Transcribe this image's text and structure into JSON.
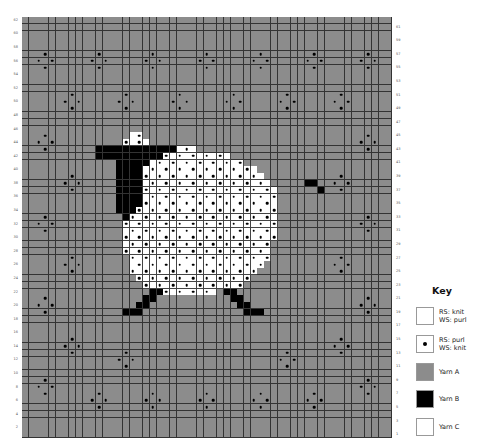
{
  "chart_data": {
    "type": "table",
    "grid": {
      "columns": 55,
      "rows": 62,
      "row_label_start": 1,
      "left_labels": "even rows",
      "right_labels": "odd rows"
    },
    "colors": {
      "yarn_a": "#8c8c8c",
      "yarn_b": "#000000",
      "yarn_c": "#ffffff",
      "grid_line": "#333333"
    },
    "background_purl_motifs": [
      {
        "center_col": 3,
        "center_row": 56
      },
      {
        "center_col": 11,
        "center_row": 56
      },
      {
        "center_col": 19,
        "center_row": 56
      },
      {
        "center_col": 27,
        "center_row": 56
      },
      {
        "center_col": 35,
        "center_row": 56
      },
      {
        "center_col": 43,
        "center_row": 56
      },
      {
        "center_col": 51,
        "center_row": 56
      },
      {
        "center_col": 7,
        "center_row": 50
      },
      {
        "center_col": 15,
        "center_row": 50
      },
      {
        "center_col": 23,
        "center_row": 50
      },
      {
        "center_col": 31,
        "center_row": 50
      },
      {
        "center_col": 39,
        "center_row": 50
      },
      {
        "center_col": 47,
        "center_row": 50
      },
      {
        "center_col": 3,
        "center_row": 44
      },
      {
        "center_col": 51,
        "center_row": 44
      },
      {
        "center_col": 7,
        "center_row": 38
      },
      {
        "center_col": 47,
        "center_row": 38
      },
      {
        "center_col": 3,
        "center_row": 32
      },
      {
        "center_col": 51,
        "center_row": 32
      },
      {
        "center_col": 7,
        "center_row": 26
      },
      {
        "center_col": 47,
        "center_row": 26
      },
      {
        "center_col": 3,
        "center_row": 20
      },
      {
        "center_col": 51,
        "center_row": 20
      },
      {
        "center_col": 7,
        "center_row": 14
      },
      {
        "center_col": 47,
        "center_row": 14
      },
      {
        "center_col": 3,
        "center_row": 8
      },
      {
        "center_col": 51,
        "center_row": 8
      },
      {
        "center_col": 15,
        "center_row": 12
      },
      {
        "center_col": 39,
        "center_row": 12
      },
      {
        "center_col": 11,
        "center_row": 6
      },
      {
        "center_col": 19,
        "center_row": 6
      },
      {
        "center_col": 27,
        "center_row": 6
      },
      {
        "center_col": 35,
        "center_row": 6
      },
      {
        "center_col": 43,
        "center_row": 6
      }
    ],
    "shapes_by_row_from_top": {
      "17": [
        {
          "c": 16,
          "n": 2,
          "y": "C",
          "dot_at": [
            17
          ]
        }
      ],
      "18": [
        {
          "c": 15,
          "n": 4,
          "y": "C"
        }
      ],
      "19": [
        {
          "c": 11,
          "n": 12,
          "y": "B"
        },
        {
          "c": 23,
          "n": 3,
          "y": "C"
        }
      ],
      "20": [
        {
          "c": 11,
          "n": 10,
          "y": "B"
        },
        {
          "c": 21,
          "n": 10,
          "y": "C"
        }
      ],
      "21": [
        {
          "c": 14,
          "n": 5,
          "y": "B"
        },
        {
          "c": 19,
          "n": 14,
          "y": "C"
        }
      ],
      "22": [
        {
          "c": 14,
          "n": 4,
          "y": "B"
        },
        {
          "c": 18,
          "n": 17,
          "y": "C"
        }
      ],
      "23": [
        {
          "c": 14,
          "n": 4,
          "y": "B"
        },
        {
          "c": 18,
          "n": 18,
          "y": "C"
        }
      ],
      "24": [
        {
          "c": 14,
          "n": 4,
          "y": "B"
        },
        {
          "c": 18,
          "n": 19,
          "y": "C"
        },
        {
          "c": 42,
          "n": 2,
          "y": "B"
        }
      ],
      "25": [
        {
          "c": 14,
          "n": 4,
          "y": "B"
        },
        {
          "c": 18,
          "n": 20,
          "y": "C"
        },
        {
          "c": 44,
          "n": 1,
          "y": "B"
        }
      ],
      "26": [
        {
          "c": 14,
          "n": 4,
          "y": "B"
        },
        {
          "c": 18,
          "n": 20,
          "y": "C"
        }
      ],
      "27": [
        {
          "c": 14,
          "n": 4,
          "y": "B"
        },
        {
          "c": 18,
          "n": 20,
          "y": "C"
        }
      ],
      "28": [
        {
          "c": 14,
          "n": 3,
          "y": "B"
        },
        {
          "c": 17,
          "n": 21,
          "y": "C"
        }
      ],
      "29": [
        {
          "c": 15,
          "n": 1,
          "y": "B"
        },
        {
          "c": 16,
          "n": 22,
          "y": "C"
        }
      ],
      "30": [
        {
          "c": 15,
          "n": 23,
          "y": "C"
        }
      ],
      "31": [
        {
          "c": 15,
          "n": 23,
          "y": "C"
        }
      ],
      "32": [
        {
          "c": 15,
          "n": 23,
          "y": "C"
        }
      ],
      "33": [
        {
          "c": 15,
          "n": 22,
          "y": "C"
        }
      ],
      "34": [
        {
          "c": 15,
          "n": 22,
          "y": "C"
        }
      ],
      "35": [
        {
          "c": 16,
          "n": 21,
          "y": "C"
        }
      ],
      "36": [
        {
          "c": 16,
          "n": 20,
          "y": "C"
        }
      ],
      "37": [
        {
          "c": 16,
          "n": 19,
          "y": "C"
        }
      ],
      "38": [
        {
          "c": 17,
          "n": 17,
          "y": "C"
        }
      ],
      "39": [
        {
          "c": 18,
          "n": 15,
          "y": "C"
        }
      ],
      "40": [
        {
          "c": 19,
          "n": 2,
          "y": "B"
        },
        {
          "c": 21,
          "n": 8,
          "y": "C"
        },
        {
          "c": 30,
          "n": 2,
          "y": "B"
        }
      ],
      "41": [
        {
          "c": 18,
          "n": 2,
          "y": "B"
        },
        {
          "c": 31,
          "n": 2,
          "y": "B"
        }
      ],
      "42": [
        {
          "c": 17,
          "n": 2,
          "y": "B"
        },
        {
          "c": 32,
          "n": 2,
          "y": "B"
        }
      ],
      "43": [
        {
          "c": 15,
          "n": 3,
          "y": "B"
        },
        {
          "c": 33,
          "n": 3,
          "y": "B"
        }
      ]
    }
  },
  "key": {
    "title": "Key",
    "items": [
      {
        "swatch": "#ffffff",
        "dot": false,
        "line1": "RS: knit",
        "line2": "WS: purl"
      },
      {
        "swatch": "#ffffff",
        "dot": true,
        "line1": "RS: purl",
        "line2": "WS: knit"
      },
      {
        "swatch": "#8c8c8c",
        "dot": false,
        "line1": "Yarn A",
        "line2": ""
      },
      {
        "swatch": "#000000",
        "dot": false,
        "line1": "Yarn B",
        "line2": ""
      },
      {
        "swatch": "#ffffff",
        "dot": false,
        "line1": "Yarn C",
        "line2": ""
      }
    ]
  }
}
